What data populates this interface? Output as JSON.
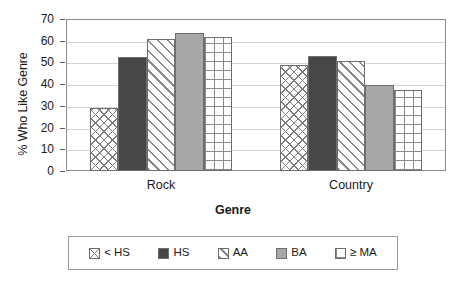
{
  "chart_data": {
    "type": "bar",
    "title": "",
    "subtitle": "",
    "xlabel": "Genre",
    "ylabel": "% Who Like Genre",
    "categories": [
      "Rock",
      "Country"
    ],
    "series": [
      {
        "name": "< HS",
        "pattern": "diagonal-crosshatch",
        "color": "#ffffff",
        "values": [
          29,
          49
        ]
      },
      {
        "name": "HS",
        "pattern": "solid-dark-gray",
        "color": "#474747",
        "values": [
          52.5,
          53
        ]
      },
      {
        "name": "AA",
        "pattern": "diagonal-stripes",
        "color": "#ffffff",
        "values": [
          61,
          50.5
        ]
      },
      {
        "name": "BA",
        "pattern": "solid-light-gray",
        "color": "#a8a8a8",
        "values": [
          63.5,
          39.5
        ]
      },
      {
        "name": "≥ MA",
        "pattern": "square-grid",
        "color": "#ffffff",
        "values": [
          61.5,
          37.5
        ]
      }
    ],
    "ylim": [
      0,
      70
    ],
    "yticks": [
      0,
      10,
      20,
      30,
      40,
      50,
      60,
      70
    ],
    "ytick_labels": [
      "0",
      "10",
      "20",
      "30",
      "40",
      "50",
      "60",
      "70"
    ],
    "grid": true,
    "grid_axis": "y",
    "legend_position": "bottom",
    "legend_entries": [
      "< HS",
      "HS",
      "AA",
      "BA",
      "≥ MA"
    ],
    "annotations": []
  },
  "axes": {
    "y_title": "% Who Like Genre",
    "x_title": "Genre"
  }
}
